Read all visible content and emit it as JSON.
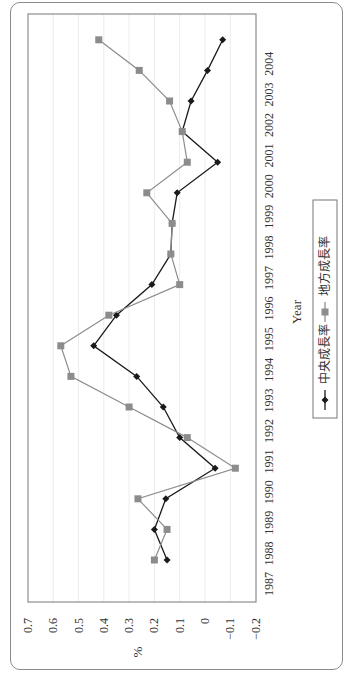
{
  "chart_data": {
    "type": "line",
    "orientation": "rotated-90-ccw",
    "title": "",
    "xlabel": "Year",
    "ylabel": "%",
    "ylim": [
      -0.2,
      0.7
    ],
    "yticks": [
      "0.7",
      "0.6",
      "0.5",
      "0.4",
      "0.3",
      "0.2",
      "0.1",
      "0",
      "−0.1",
      "−0.2"
    ],
    "ytick_values": [
      0.7,
      0.6,
      0.5,
      0.4,
      0.3,
      0.2,
      0.1,
      0,
      -0.1,
      -0.2
    ],
    "categories": [
      "1987",
      "1988",
      "1989",
      "1990",
      "1991",
      "1992",
      "1993",
      "1994",
      "1995",
      "1996",
      "1997",
      "1998",
      "1999",
      "2000",
      "2001",
      "2002",
      "2003",
      "2004"
    ],
    "grid": "vertical (value) gridlines, light",
    "legend_position": "right (below x-axis label in rotated view)",
    "series": [
      {
        "name": "中央成長率",
        "marker": "diamond",
        "color": "#1a1a1a",
        "values": [
          0.15,
          0.2,
          0.155,
          -0.04,
          0.1,
          0.165,
          0.27,
          0.44,
          0.35,
          0.21,
          0.135,
          0.13,
          0.11,
          -0.05,
          0.09,
          0.055,
          -0.01,
          -0.07
        ]
      },
      {
        "name": "地方成長率",
        "marker": "square",
        "color": "#8c8c8c",
        "values": [
          0.2,
          0.15,
          0.265,
          -0.12,
          0.07,
          0.3,
          0.53,
          0.57,
          0.38,
          0.1,
          0.135,
          0.13,
          0.23,
          0.07,
          0.09,
          0.14,
          0.26,
          0.42
        ]
      }
    ]
  }
}
